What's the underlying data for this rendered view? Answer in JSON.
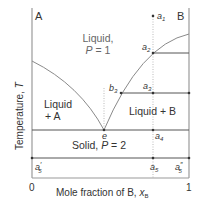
{
  "diagram": {
    "type": "binary eutectic phase diagram",
    "corner_labels": {
      "left": "A",
      "right": "B"
    },
    "y_axis_label": "Temperature, T",
    "y_axis_label_plain": "Temperature, ",
    "y_axis_label_var": "T",
    "x_axis_label_plain": "Mole fraction of B, ",
    "x_axis_label_var": "x",
    "x_axis_label_sub": "B",
    "x_ticks": {
      "min": "0",
      "max": "1"
    },
    "regions": {
      "liquid_line1": "Liquid,",
      "liquid_line2_var": "P",
      "liquid_line2_rest": " = 1",
      "liquid_a_line1": "Liquid",
      "liquid_a_line2": "+ A",
      "liquid_b": "Liquid + B",
      "solid_plain": "Solid, ",
      "solid_var": "P",
      "solid_rest": " = 2"
    },
    "points": {
      "a1": {
        "base": "a",
        "sub": "1"
      },
      "a2": {
        "base": "a",
        "sub": "2"
      },
      "a3": {
        "base": "a",
        "sub": "3"
      },
      "a4": {
        "base": "a",
        "sub": "4"
      },
      "a5": {
        "base": "a",
        "sub": "5"
      },
      "a5p": {
        "base": "a",
        "prime": "′",
        "sub": "5"
      },
      "a5pp": {
        "base": "a",
        "prime": "″",
        "sub": "5"
      },
      "b3": {
        "base": "b",
        "sub": "3"
      },
      "e": {
        "base": "e"
      }
    },
    "colors": {
      "axis": "#9a9a9a",
      "curve": "#8a8a8a",
      "tieline": "#555555",
      "text": "#333333",
      "dotted": "#aaaaaa"
    }
  }
}
